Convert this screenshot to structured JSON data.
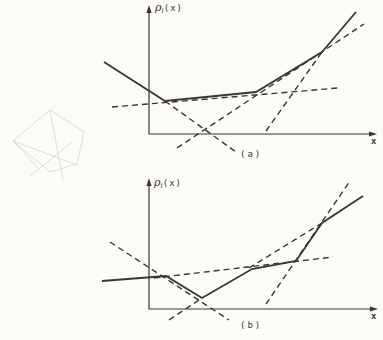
{
  "style": {
    "ink_color": "#3a3733",
    "background_color": "#fcfbf8",
    "dash_pattern": "6 4"
  },
  "doodle": {
    "description": "faint-pencil-scribble-polyhedron",
    "color": "#c6c4bc",
    "opacity": 0.55,
    "polylines": [
      [
        [
          50,
          110
        ],
        [
          13,
          141
        ]
      ],
      [
        [
          50,
          110
        ],
        [
          84,
          132
        ]
      ],
      [
        [
          84,
          132
        ],
        [
          77,
          164
        ]
      ],
      [
        [
          13,
          141
        ],
        [
          50,
          172
        ],
        [
          77,
          164
        ]
      ],
      [
        [
          13,
          141
        ],
        [
          77,
          165
        ]
      ],
      [
        [
          50,
          110
        ],
        [
          63,
          180
        ]
      ],
      [
        [
          72,
          142
        ],
        [
          30,
          176
        ]
      ],
      [
        [
          13,
          141
        ],
        [
          38,
          168
        ]
      ]
    ]
  },
  "chart_data": [
    {
      "type": "line",
      "id": "a",
      "title": "",
      "caption": "(a)",
      "x_label": "x",
      "y_label": "ρᵢ(x)",
      "y_label_parts": {
        "base": "ρ",
        "sub": "i",
        "rest": "(x)"
      },
      "units": "pixel coordinates of qualitative sketch (no numeric scale shown)",
      "axes": {
        "origin": [
          149,
          134
        ],
        "y_top": [
          149,
          5
        ],
        "x_end": [
          377,
          134
        ]
      },
      "series": [
        {
          "name": "piecewise-linear-function",
          "style": "solid",
          "points": [
            [
              104,
              62
            ],
            [
              165,
              101
            ],
            [
              256,
              92
            ],
            [
              322,
              52
            ],
            [
              356,
              12
            ]
          ]
        },
        {
          "name": "affine-piece-2-extension",
          "style": "dashed",
          "points": [
            [
              112,
              107
            ],
            [
              338,
              88
            ]
          ]
        },
        {
          "name": "affine-piece-1-extension",
          "style": "dashed",
          "points": [
            [
              165,
              101
            ],
            [
              236,
              152
            ]
          ]
        },
        {
          "name": "affine-piece-3-extension",
          "style": "dashed",
          "points": [
            [
              177,
              148
            ],
            [
              364,
              24
            ]
          ]
        },
        {
          "name": "affine-piece-4-extension",
          "style": "dashed",
          "points": [
            [
              266,
              131
            ],
            [
              322,
              52
            ]
          ]
        }
      ]
    },
    {
      "type": "line",
      "id": "b",
      "title": "",
      "caption": "(b)",
      "x_label": "x",
      "y_label": "ρᵢ(x)",
      "y_label_parts": {
        "base": "ρ",
        "sub": "i",
        "rest": "(x)"
      },
      "units": "pixel coordinates of qualitative sketch (no numeric scale shown)",
      "axes": {
        "origin": [
          149,
          309
        ],
        "y_top": [
          149,
          178
        ],
        "x_end": [
          378,
          309
        ]
      },
      "series": [
        {
          "name": "piecewise-linear-function",
          "style": "solid",
          "points": [
            [
              102,
              281
            ],
            [
              166,
              276
            ],
            [
              202,
              298
            ],
            [
              252,
              269
            ],
            [
              296,
              261
            ],
            [
              322,
              223
            ],
            [
              363,
              196
            ]
          ]
        },
        {
          "name": "affine-descending-extension",
          "style": "dashed",
          "points": [
            [
              110,
              242
            ],
            [
              229,
              320
            ]
          ]
        },
        {
          "name": "affine-ascending-extension",
          "style": "dashed",
          "points": [
            [
              169,
              320
            ],
            [
              202,
              298
            ]
          ]
        },
        {
          "name": "affine-steep-extension",
          "style": "dashed",
          "points": [
            [
              266,
              304
            ],
            [
              350,
              181
            ]
          ]
        },
        {
          "name": "affine-final-extension",
          "style": "dashed",
          "points": [
            [
              249,
              268
            ],
            [
              322,
              223
            ]
          ]
        },
        {
          "name": "affine-shallow-extension",
          "style": "dashed",
          "points": [
            [
              154,
              278
            ],
            [
              333,
              257
            ]
          ]
        }
      ]
    }
  ]
}
